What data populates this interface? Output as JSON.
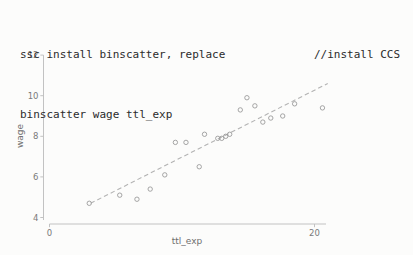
{
  "code": {
    "line1_left": "ssc install binscatter, replace",
    "line1_right": "//install CCS",
    "line2": "binscatter wage ttl_exp"
  },
  "chart_data": {
    "type": "scatter",
    "title": "",
    "xlabel": "ttl_exp",
    "ylabel": "wage",
    "xlim": [
      0,
      21
    ],
    "ylim": [
      4,
      12
    ],
    "x_ticks": [
      0,
      20
    ],
    "y_ticks": [
      4,
      6,
      8,
      10,
      12
    ],
    "grid": false,
    "legend": "none",
    "points": [
      [
        3.0,
        4.7
      ],
      [
        5.3,
        5.1
      ],
      [
        6.6,
        4.9
      ],
      [
        7.6,
        5.4
      ],
      [
        8.7,
        6.1
      ],
      [
        9.5,
        7.7
      ],
      [
        10.3,
        7.7
      ],
      [
        11.3,
        6.5
      ],
      [
        11.7,
        8.1
      ],
      [
        12.7,
        7.9
      ],
      [
        13.0,
        7.9
      ],
      [
        13.3,
        8.0
      ],
      [
        13.6,
        8.1
      ],
      [
        14.4,
        9.3
      ],
      [
        14.9,
        9.9
      ],
      [
        15.5,
        9.5
      ],
      [
        16.1,
        8.7
      ],
      [
        16.7,
        8.9
      ],
      [
        17.6,
        9.0
      ],
      [
        18.5,
        9.6
      ],
      [
        20.6,
        9.4
      ]
    ],
    "fit_line": {
      "x1": 3.1,
      "y1": 4.7,
      "x2": 21.0,
      "y2": 10.6,
      "style": "dashed"
    },
    "colors": {
      "marker": "#9b9b9b",
      "fit_line": "#b3b3b3",
      "axis": "#c2c2c2",
      "tick_label": "#7a7a7a",
      "axis_label": "#6e6e6e"
    }
  }
}
